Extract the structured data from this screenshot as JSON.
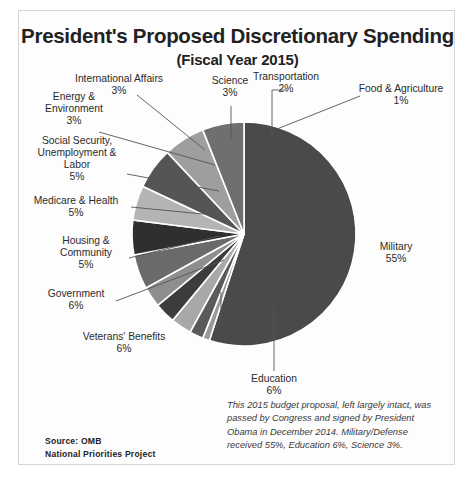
{
  "chart_data": {
    "type": "pie",
    "title": "President's Proposed Discretionary Spending",
    "subtitle": "(Fiscal Year 2015)",
    "categories": [
      "Military",
      "Food & Agriculture",
      "Transportation",
      "Science",
      "International Affairs",
      "Energy & Environment",
      "Social Security, Unemployment & Labor",
      "Medicare & Health",
      "Housing & Community",
      "Government",
      "Veterans' Benefits",
      "Education"
    ],
    "values": [
      55,
      1,
      2,
      3,
      3,
      3,
      5,
      5,
      5,
      6,
      6,
      6
    ],
    "unit": "%",
    "legend": "none",
    "grid": false,
    "colors": [
      "#4a4a4a",
      "#9a9a9a",
      "#5a5a5a",
      "#a8a8a8",
      "#3c3c3c",
      "#8e8e8e",
      "#6a6a6a",
      "#2f2f2f",
      "#b4b4b4",
      "#555555",
      "#9e9e9e",
      "#6f6f6f"
    ],
    "slices": [
      {
        "label": "Military",
        "pct": "55%",
        "value": 55,
        "color": "#4a4a4a"
      },
      {
        "label": "Food & Agriculture",
        "pct": "1%",
        "value": 1,
        "color": "#9a9a9a"
      },
      {
        "label": "Transportation",
        "pct": "2%",
        "value": 2,
        "color": "#5a5a5a"
      },
      {
        "label": "Science",
        "pct": "3%",
        "value": 3,
        "color": "#a8a8a8"
      },
      {
        "label": "International Affairs",
        "pct": "3%",
        "value": 3,
        "color": "#3c3c3c"
      },
      {
        "label": "Energy & Environment",
        "pct": "3%",
        "value": 3,
        "color": "#8e8e8e"
      },
      {
        "label": "Social Security, Unemployment & Labor",
        "pct": "5%",
        "value": 5,
        "color": "#6a6a6a"
      },
      {
        "label": "Medicare & Health",
        "pct": "5%",
        "value": 5,
        "color": "#2f2f2f"
      },
      {
        "label": "Housing & Community",
        "pct": "5%",
        "value": 5,
        "color": "#b4b4b4"
      },
      {
        "label": "Government",
        "pct": "6%",
        "value": 6,
        "color": "#555555"
      },
      {
        "label": "Veterans' Benefits",
        "pct": "6%",
        "value": 6,
        "color": "#9e9e9e"
      },
      {
        "label": "Education",
        "pct": "6%",
        "value": 6,
        "color": "#6f6f6f"
      }
    ]
  },
  "labels": {
    "military": {
      "name": "Military",
      "pct": "55%"
    },
    "food": {
      "name": "Food & Agriculture",
      "pct": "1%"
    },
    "transportation": {
      "name": "Transportation",
      "pct": "2%"
    },
    "science": {
      "name": "Science",
      "pct": "3%"
    },
    "international": {
      "name": "International  Affairs",
      "pct": "3%"
    },
    "energy": {
      "name_l1": "Energy &",
      "name_l2": "Environment",
      "pct": "3%"
    },
    "socialsecurity": {
      "name_l1": "Social Security,",
      "name_l2": "Unemployment  &",
      "name_l3": "Labor",
      "pct": "5%"
    },
    "medicare": {
      "name": "Medicare  &  Health",
      "pct": "5%"
    },
    "housing": {
      "name_l1": "Housing  &",
      "name_l2": "Community",
      "pct": "5%"
    },
    "government": {
      "name": "Government",
      "pct": "6%"
    },
    "veterans": {
      "name": "Veterans'  Benefits",
      "pct": "6%"
    },
    "education": {
      "name": "Education",
      "pct": "6%"
    }
  },
  "note": "This 2015 budget proposal, left largely intact, was passed by Congress and signed by President Obama in December 2014. Military/Defense received 55%, Education 6%, Science 3%.",
  "source": {
    "line1": "Source: OMB",
    "line2": "National Priorities Project"
  }
}
